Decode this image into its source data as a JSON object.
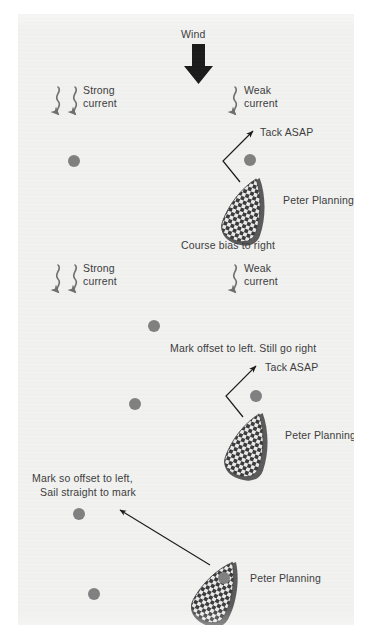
{
  "diagram": {
    "background_color": "#f1f1f0",
    "page_color": "#ffffff",
    "mark_color": "#808080",
    "text_color": "#3b3b3b",
    "arrow_color": "#1a1a1a",
    "current_color": "#6e6e6e"
  },
  "wind": {
    "label": "Wind",
    "direction": "down"
  },
  "currents": [
    {
      "id": "strong-top",
      "label_line1": "Strong",
      "label_line2": "current",
      "strength": "strong",
      "arrows": 2,
      "side": "left"
    },
    {
      "id": "weak-top",
      "label_line1": "Weak",
      "label_line2": "current",
      "strength": "weak",
      "arrows": 1,
      "side": "right"
    },
    {
      "id": "strong-mid",
      "label_line1": "Strong",
      "label_line2": "current",
      "strength": "strong",
      "arrows": 2,
      "side": "left"
    },
    {
      "id": "weak-mid",
      "label_line1": "Weak",
      "label_line2": "current",
      "strength": "weak",
      "arrows": 1,
      "side": "right"
    }
  ],
  "annotations": {
    "tack_asap_top": "Tack ASAP",
    "peter_planning_top": "Peter Planning",
    "course_bias": "Course bias to right",
    "mark_offset_left": "Mark offset to left. Still go right",
    "tack_asap_mid": "Tack ASAP",
    "peter_planning_mid": "Peter Planning",
    "mark_so_offset_line1": "Mark so offset to left,",
    "mark_so_offset_line2": "Sail straight to mark",
    "peter_planning_bottom": "Peter Planning"
  },
  "marks": [
    {
      "id": "mark-top-left",
      "x": 56,
      "y": 147
    },
    {
      "id": "mark-top-right",
      "x": 232,
      "y": 146
    },
    {
      "id": "mark-mid-upper",
      "x": 136,
      "y": 312
    },
    {
      "id": "mark-mid-lower",
      "x": 117,
      "y": 390
    },
    {
      "id": "mark-mid-right",
      "x": 238,
      "y": 382
    },
    {
      "id": "mark-low-upper",
      "x": 61,
      "y": 500
    },
    {
      "id": "mark-low-lower",
      "x": 76,
      "y": 580
    },
    {
      "id": "mark-low-right",
      "x": 206,
      "y": 564
    }
  ],
  "boats": [
    {
      "id": "boat-top",
      "name": "Peter Planning",
      "rotation_deg": 20,
      "scenario": "Course bias to right"
    },
    {
      "id": "boat-mid",
      "name": "Peter Planning",
      "rotation_deg": 20,
      "scenario": "Mark offset to left. Still go right"
    },
    {
      "id": "boat-bottom",
      "name": "Peter Planning",
      "rotation_deg": 28,
      "scenario": "Mark so offset to left, Sail straight to mark"
    }
  ]
}
